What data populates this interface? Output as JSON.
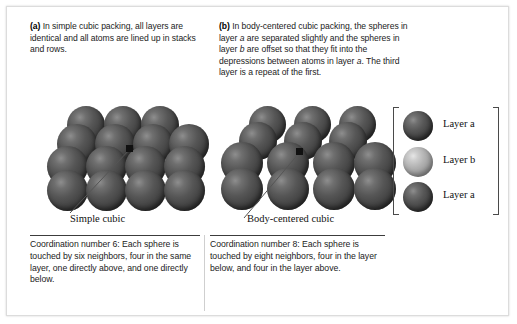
{
  "figure": {
    "panels": [
      {
        "marker": "(a)",
        "description": "In simple cubic packing, all layers are identical and all atoms are lined up in stacks and rows.",
        "structure_label": "Simple cubic",
        "coordination_caption": "Coordination number 6: Each sphere is touched by six neighbors, four in the same layer, one directly above, and one directly below."
      },
      {
        "marker": "(b)",
        "description_part1": "In body-centered cubic packing, the spheres in layer ",
        "description_italic1": "a",
        "description_part2": " are separated slightly and the spheres in layer ",
        "description_italic2": "b",
        "description_part3": " are offset so that they fit into the depressions between atoms in layer ",
        "description_italic3": "a",
        "description_part4": ". The third layer is a repeat of the first.",
        "structure_label": "Body-centered cubic",
        "coordination_caption": "Coordination number 8: Each sphere is touched by eight neighbors, four in the layer below, and four in the layer above."
      }
    ],
    "legend": {
      "items": [
        {
          "label": "Layer a",
          "shade": "dark"
        },
        {
          "label": "Layer b",
          "shade": "light"
        },
        {
          "label": "Layer a",
          "shade": "dark"
        }
      ]
    },
    "colors": {
      "sphere_dark": "#565656",
      "sphere_light": "#b2b2b2",
      "text": "#1b1b1b",
      "rule": "#3c3c3c",
      "frame_border": "#dcdcdc"
    }
  }
}
